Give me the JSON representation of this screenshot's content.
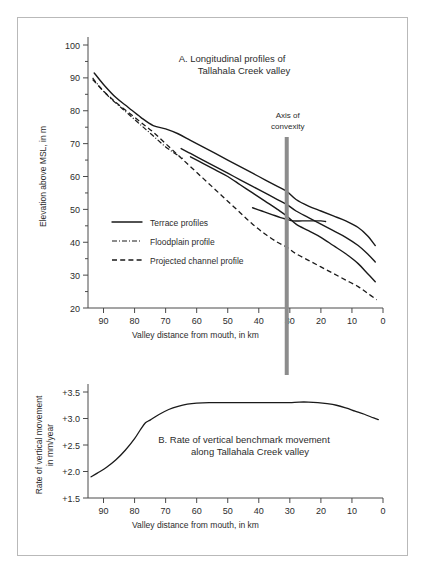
{
  "figure": {
    "background_color": "#ffffff",
    "frame_color": "#b9b9b9",
    "line_color": "#1a1a1a",
    "axis_color": "#4a4a4a",
    "convexity_bar_color": "#8c8c8c"
  },
  "annotations": {
    "axis_of_convexity_line1": "Axis of",
    "axis_of_convexity_line2": "convexity",
    "axis_of_convexity_x": 31
  },
  "legend": {
    "items": [
      {
        "label": "Terrace profiles",
        "style": "solid"
      },
      {
        "label": "Floodplain profile",
        "style": "dashdot"
      },
      {
        "label": "Projected channel profile",
        "style": "dashed"
      }
    ]
  },
  "chart_data": [
    {
      "type": "line",
      "panel": "A",
      "title": "A.  Longitudinal profiles of",
      "title_line2": "Tallahala Creek valley",
      "xlabel": "Valley distance from mouth,  in km",
      "ylabel": "Elevation above MSL, in m",
      "xlim": [
        95,
        0
      ],
      "ylim": [
        20,
        100
      ],
      "x_ticks": [
        90,
        80,
        70,
        60,
        50,
        40,
        30,
        20,
        10,
        0
      ],
      "y_ticks": [
        20,
        30,
        40,
        50,
        60,
        70,
        80,
        90,
        100
      ],
      "x_reversed": true,
      "grid": false,
      "legend_position": "inner-left",
      "series": [
        {
          "name": "Terrace profile 1 (highest)",
          "style": "solid",
          "x": [
            93.0,
            90.0,
            86.0,
            82.0,
            78.0,
            74.0,
            70.0,
            66.0,
            62.0,
            58.0,
            54.0,
            50.0,
            46.0,
            42.0,
            38.0,
            34.0,
            31.0,
            28.0,
            24.0,
            20.0,
            16.0,
            12.0,
            8.0,
            5.0,
            2.5
          ],
          "y": [
            91.5,
            88.0,
            84.0,
            81.0,
            78.0,
            75.5,
            74.5,
            73.0,
            71.0,
            69.0,
            67.0,
            65.0,
            63.0,
            61.0,
            59.0,
            57.0,
            55.5,
            53.0,
            51.0,
            49.5,
            48.0,
            46.5,
            44.5,
            42.0,
            39.0
          ]
        },
        {
          "name": "Terrace profile 2",
          "style": "solid",
          "x": [
            65.0,
            62.0,
            58.0,
            54.0,
            50.0,
            46.0,
            42.0,
            38.0,
            34.0,
            31.0,
            28.0,
            24.0,
            20.0,
            16.0,
            12.0,
            8.0,
            5.0,
            2.5
          ],
          "y": [
            68.5,
            67.0,
            65.0,
            63.0,
            61.0,
            59.0,
            57.0,
            55.0,
            53.0,
            51.5,
            49.5,
            47.5,
            45.5,
            43.5,
            41.5,
            39.0,
            36.5,
            34.0
          ]
        },
        {
          "name": "Terrace profile 3",
          "style": "solid",
          "x": [
            62.0,
            58.0,
            54.0,
            50.0,
            46.0,
            42.0,
            38.0,
            34.0,
            31.0,
            28.0,
            24.0,
            20.0,
            16.0,
            12.0,
            8.0,
            5.0,
            2.5
          ],
          "y": [
            66.0,
            64.0,
            62.0,
            60.0,
            57.5,
            55.0,
            52.5,
            50.0,
            48.0,
            45.5,
            43.5,
            41.5,
            39.0,
            36.5,
            33.5,
            30.5,
            28.0
          ]
        },
        {
          "name": "Terrace profile 4 (short, middle)",
          "style": "solid",
          "x": [
            42.0,
            39.0,
            36.0,
            33.0,
            31.0,
            29.0,
            26.0,
            23.0,
            20.0,
            18.5
          ],
          "y": [
            50.5,
            49.5,
            48.5,
            47.5,
            47.0,
            46.5,
            46.5,
            46.5,
            46.5,
            46.3
          ]
        },
        {
          "name": "Floodplain profile",
          "style": "dashdot",
          "x": [
            93.5,
            91.0,
            88.0,
            85.0,
            82.0,
            79.0,
            76.0,
            73.0,
            70.0,
            67.0,
            64.5
          ],
          "y": [
            90.0,
            87.0,
            84.0,
            81.5,
            79.0,
            76.5,
            74.0,
            71.5,
            69.0,
            67.0,
            65.5
          ]
        },
        {
          "name": "Projected channel profile",
          "style": "dashed",
          "x": [
            93.5,
            90.0,
            86.0,
            82.0,
            78.0,
            74.0,
            70.0,
            66.0,
            62.0,
            58.0,
            54.0,
            50.0,
            46.0,
            42.0,
            38.0,
            34.0,
            31.0,
            28.0,
            24.0,
            20.0,
            16.0,
            12.0,
            8.0,
            5.0,
            2.0
          ],
          "y": [
            89.5,
            86.0,
            82.5,
            79.5,
            76.5,
            73.5,
            70.0,
            66.5,
            63.0,
            59.5,
            56.0,
            52.5,
            49.0,
            45.5,
            42.5,
            40.0,
            38.5,
            36.5,
            34.5,
            32.5,
            30.5,
            28.5,
            26.5,
            24.5,
            22.5
          ]
        }
      ]
    },
    {
      "type": "line",
      "panel": "B",
      "title": "B.  Rate of vertical benchmark movement",
      "title_line2": "along Tallahala Creek valley",
      "xlabel": "Valley distance from mouth,  in km",
      "ylabel": "Rate of vertical movement",
      "ylabel_line2": "in mm/year",
      "xlim": [
        95,
        0
      ],
      "ylim": [
        1.5,
        3.5
      ],
      "x_ticks": [
        90,
        80,
        70,
        60,
        50,
        40,
        30,
        20,
        10,
        0
      ],
      "y_ticks": [
        "+1.5",
        "+2.0",
        "+2.5",
        "+3.0",
        "+3.5"
      ],
      "y_tick_values": [
        1.5,
        2.0,
        2.5,
        3.0,
        3.5
      ],
      "x_reversed": true,
      "grid": false,
      "series": [
        {
          "name": "Rate of vertical benchmark movement",
          "style": "solid",
          "x": [
            94.0,
            92.0,
            89.0,
            86.0,
            83.0,
            80.0,
            78.0,
            76.5,
            75.0,
            72.0,
            69.0,
            66.0,
            63.0,
            60.0,
            56.0,
            50.0,
            44.0,
            38.0,
            33.0,
            30.0,
            27.0,
            24.0,
            21.0,
            18.0,
            15.0,
            12.0,
            9.0,
            6.0,
            3.0,
            1.5
          ],
          "y": [
            1.9,
            1.97,
            2.08,
            2.22,
            2.4,
            2.62,
            2.8,
            2.92,
            2.97,
            3.08,
            3.17,
            3.23,
            3.27,
            3.29,
            3.3,
            3.3,
            3.3,
            3.3,
            3.3,
            3.3,
            3.31,
            3.31,
            3.3,
            3.28,
            3.25,
            3.2,
            3.14,
            3.08,
            3.01,
            2.98
          ]
        }
      ]
    }
  ]
}
